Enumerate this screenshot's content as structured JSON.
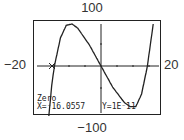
{
  "window": {
    "xmin": "−20",
    "xmax": "20",
    "ymin": "−100",
    "ymax": "100"
  },
  "readout": {
    "mode": "Zero",
    "x": "X=⁻16.0557",
    "y": "Y=1E⁻11"
  },
  "chart_data": {
    "type": "line",
    "title": "",
    "xlabel": "",
    "ylabel": "",
    "xlim": [
      -20,
      20
    ],
    "ylim": [
      -100,
      100
    ],
    "grid": false,
    "series": [
      {
        "name": "cubic",
        "x": [
          -20,
          -17,
          -16.0557,
          -14,
          -12,
          -10,
          -8,
          -4,
          0,
          4,
          8,
          10,
          12,
          14,
          16,
          18,
          20
        ],
        "y": [
          -160,
          -28,
          0,
          40,
          58,
          60,
          54,
          30,
          0,
          -30,
          -52,
          -58,
          -58,
          -40,
          0,
          60,
          160
        ]
      }
    ],
    "annotations": [
      "Zero",
      "X=-16.0557",
      "Y=1E-11"
    ],
    "zero_point": {
      "x": -16.0557,
      "y": 0
    }
  }
}
